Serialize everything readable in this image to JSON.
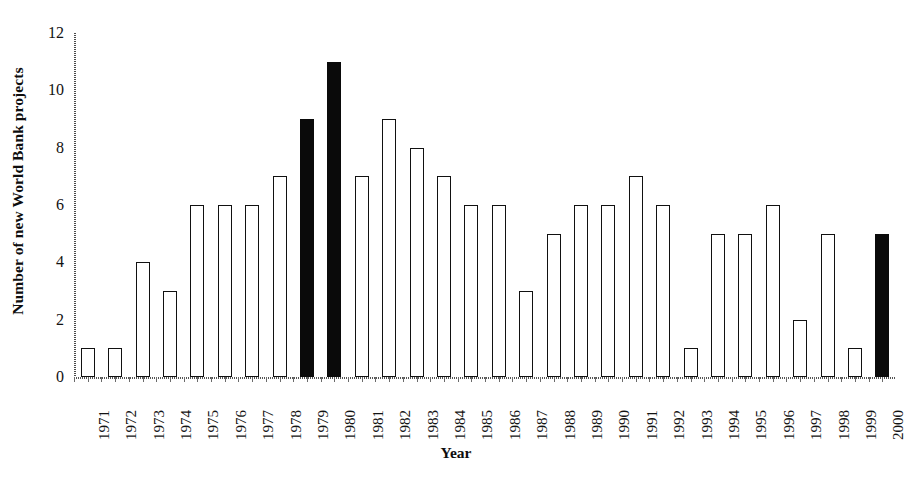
{
  "chart_data": {
    "type": "bar",
    "title": "",
    "xlabel": "Year",
    "ylabel": "Number of new World Bank projects",
    "ylim": [
      0,
      12
    ],
    "yticks": [
      0,
      2,
      4,
      6,
      8,
      10,
      12
    ],
    "grid": false,
    "legend": null,
    "categories": [
      "1971",
      "1972",
      "1973",
      "1974",
      "1975",
      "1976",
      "1977",
      "1978",
      "1979",
      "1980",
      "1981",
      "1982",
      "1983",
      "1984",
      "1985",
      "1986",
      "1987",
      "1988",
      "1989",
      "1990",
      "1991",
      "1992",
      "1993",
      "1994",
      "1995",
      "1996",
      "1997",
      "1998",
      "1999",
      "2000"
    ],
    "values": [
      1,
      1,
      4,
      3,
      6,
      6,
      6,
      7,
      9,
      11,
      7,
      9,
      8,
      7,
      6,
      6,
      3,
      5,
      6,
      6,
      7,
      6,
      1,
      5,
      5,
      6,
      2,
      5,
      1,
      5
    ],
    "highlighted_categories": [
      "1979",
      "1980",
      "2000"
    ],
    "bar_styles": [
      "open",
      "open",
      "open",
      "open",
      "open",
      "open",
      "open",
      "open",
      "filled",
      "filled",
      "open",
      "open",
      "open",
      "open",
      "open",
      "open",
      "open",
      "open",
      "open",
      "open",
      "open",
      "open",
      "open",
      "open",
      "open",
      "open",
      "open",
      "open",
      "open",
      "filled"
    ],
    "colors": {
      "bar_open_fill": "#ffffff",
      "bar_open_edge": "#111111",
      "bar_filled": "#0a0a0a",
      "axis": "#555555",
      "text": "#121212"
    }
  }
}
